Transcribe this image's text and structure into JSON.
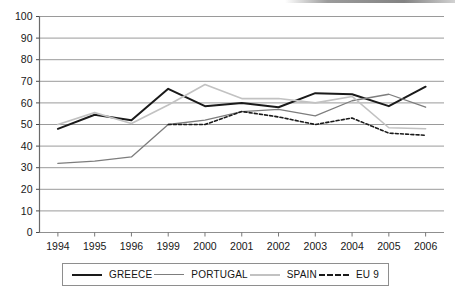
{
  "chart_data": {
    "type": "line",
    "title": "",
    "xlabel": "",
    "ylabel": "",
    "categories": [
      "1994",
      "1995",
      "1996",
      "1999",
      "2000",
      "2001",
      "2002",
      "2003",
      "2004",
      "2005",
      "2006"
    ],
    "ylim": [
      0,
      100
    ],
    "yticks": [
      0,
      10,
      20,
      30,
      40,
      50,
      60,
      70,
      80,
      90,
      100
    ],
    "grid": "horizontal",
    "legend_position": "bottom",
    "series": [
      {
        "name": "GREECE",
        "color": "#1a1a1a",
        "style": "solid",
        "width": 2.0,
        "values": [
          48,
          54.5,
          52,
          66.5,
          58.5,
          60,
          58,
          64.5,
          64,
          58.5,
          67.5
        ]
      },
      {
        "name": "PORTUGAL",
        "color": "#7d7d7d",
        "style": "solid",
        "width": 1.3,
        "values": [
          32,
          33,
          35,
          50,
          52,
          56,
          57,
          54,
          61,
          64,
          58
        ]
      },
      {
        "name": "SPAIN",
        "color": "#c2c2c2",
        "style": "solid",
        "width": 1.6,
        "values": [
          50,
          55.5,
          50.5,
          59,
          68.5,
          62,
          62,
          60,
          63,
          48.5,
          48
        ]
      },
      {
        "name": "EU 9",
        "color": "#1a1a1a",
        "style": "dashed",
        "width": 1.6,
        "values": [
          null,
          null,
          null,
          50,
          50,
          56,
          53.5,
          50,
          53,
          46,
          45
        ]
      }
    ]
  },
  "axis": {
    "ytick_labels": [
      "100",
      "90",
      "80",
      "70",
      "60",
      "50",
      "40",
      "30",
      "20",
      "10",
      "0"
    ],
    "xtick_labels": [
      "1994",
      "1995",
      "1996",
      "1999",
      "2000",
      "2001",
      "2002",
      "2003",
      "2004",
      "2005",
      "2006"
    ]
  },
  "legend": {
    "items": [
      {
        "label": "GREECE",
        "swatch": "legend-line-greece"
      },
      {
        "label": "PORTUGAL",
        "swatch": "legend-line-portugal"
      },
      {
        "label": "SPAIN",
        "swatch": "legend-line-spain"
      },
      {
        "label": "EU 9",
        "swatch": "legend-line-eu9"
      }
    ]
  }
}
